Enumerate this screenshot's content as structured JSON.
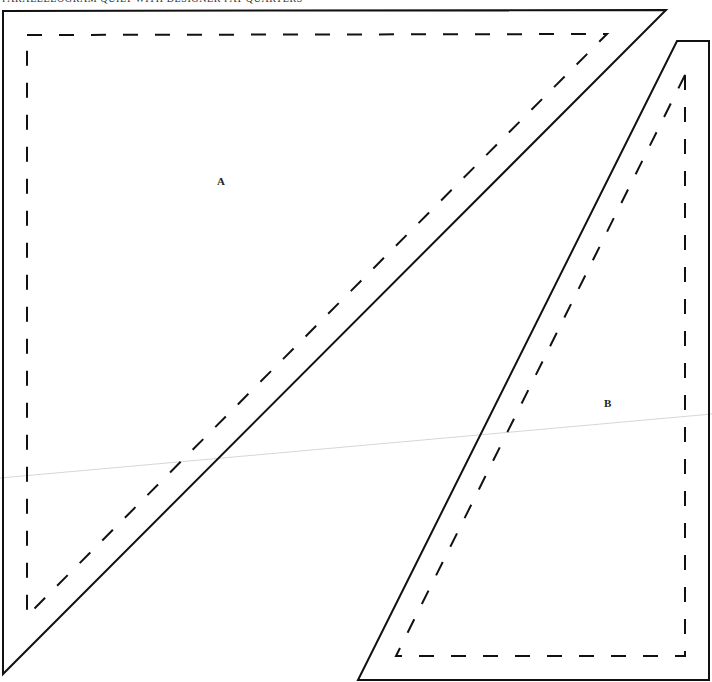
{
  "page": {
    "header": "PARALLELOGRAM QUILT WITH DESIGNER FAT QUARTERS"
  },
  "pattern_pieces": [
    {
      "id": "A",
      "label": "A",
      "shape": "right-triangle",
      "outer_points": "3,11 666,10 3,674",
      "seam_points": "27,35 607,34 27,616",
      "label_position": {
        "x": 217,
        "y": 175
      }
    },
    {
      "id": "B",
      "label": "B",
      "shape": "trapezoid",
      "outer_points": "677,41 709,41 709,680 358,680",
      "seam_points": "685,75 685,656 396,656",
      "label_position": {
        "x": 604,
        "y": 397
      }
    }
  ],
  "colors": {
    "line": "#111111",
    "fold_line": "#d6d6d6",
    "background": "#ffffff"
  }
}
